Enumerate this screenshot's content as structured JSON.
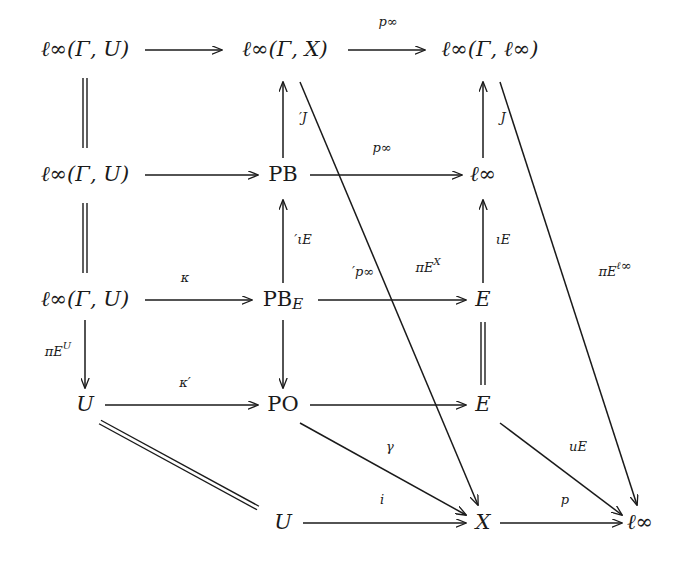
{
  "diagram": {
    "ink_color": "#1a1a1a",
    "background_color": "#ffffff",
    "nodes": [
      {
        "id": "n_r1c1",
        "label": "ℓ∞(Γ, U)",
        "x": 85,
        "y": 50,
        "style": "italic"
      },
      {
        "id": "n_r1c2",
        "label": "ℓ∞(Γ, X)",
        "x": 285,
        "y": 50,
        "style": "italic"
      },
      {
        "id": "n_r1c3",
        "label": "ℓ∞(Γ, ℓ∞)",
        "x": 490,
        "y": 50,
        "style": "italic"
      },
      {
        "id": "n_r2c1",
        "label": "ℓ∞(Γ, U)",
        "x": 85,
        "y": 175,
        "style": "italic"
      },
      {
        "id": "n_r2c2",
        "label": "PB",
        "x": 283,
        "y": 175,
        "style": "upright"
      },
      {
        "id": "n_r2c3",
        "label": "ℓ∞",
        "x": 483,
        "y": 175,
        "style": "italic"
      },
      {
        "id": "n_r3c1",
        "label": "ℓ∞(Γ, U)",
        "x": 85,
        "y": 300,
        "style": "italic"
      },
      {
        "id": "n_r3c2",
        "label": "PB_E",
        "x": 283,
        "y": 300,
        "style": "upright"
      },
      {
        "id": "n_r3c3",
        "label": "E",
        "x": 483,
        "y": 300,
        "style": "italic"
      },
      {
        "id": "n_r4c1",
        "label": "U",
        "x": 85,
        "y": 405,
        "style": "italic"
      },
      {
        "id": "n_r4c2",
        "label": "PO",
        "x": 283,
        "y": 405,
        "style": "upright"
      },
      {
        "id": "n_r4c3",
        "label": "E",
        "x": 483,
        "y": 405,
        "style": "italic"
      },
      {
        "id": "n_r5c1",
        "label": "U",
        "x": 283,
        "y": 523,
        "style": "italic"
      },
      {
        "id": "n_r5c2",
        "label": "X",
        "x": 483,
        "y": 523,
        "style": "italic"
      },
      {
        "id": "n_r5c3",
        "label": "ℓ∞",
        "x": 640,
        "y": 523,
        "style": "italic"
      }
    ],
    "edge_labels": [
      {
        "id": "lbl_p_inf_top",
        "text": "p∞",
        "x": 388,
        "y": 22,
        "note": "above top-right horizontal arrow"
      },
      {
        "id": "lbl_J_prime",
        "text": "′J",
        "x": 303,
        "y": 118,
        "note": "right of PB up-arrow"
      },
      {
        "id": "lbl_J",
        "text": "J",
        "x": 503,
        "y": 118,
        "note": "right of l-infinity up-arrow"
      },
      {
        "id": "lbl_p_inf_row2",
        "text": "p∞",
        "x": 382,
        "y": 148,
        "note": "above PB to l-infinity arrow"
      },
      {
        "id": "lbl_iota_prime_E",
        "text": "′ιE",
        "x": 303,
        "y": 240,
        "note": "right of PB_E up-arrow"
      },
      {
        "id": "lbl_iota_E",
        "text": "ιE",
        "x": 503,
        "y": 240,
        "note": "right of E up-arrow"
      },
      {
        "id": "lbl_kappa",
        "text": "κ",
        "x": 185,
        "y": 278,
        "note": "above l-infinity(G,U) to PB_E arrow"
      },
      {
        "id": "lbl_p_inf_prime",
        "text": "′p∞",
        "x": 363,
        "y": 272,
        "note": "above PB_E to E arrow"
      },
      {
        "id": "lbl_pi_E_X",
        "text": "πE^X",
        "x": 428,
        "y": 268,
        "note": "diagonal to X"
      },
      {
        "id": "lbl_pi_E_linf",
        "text": "πE^ℓ∞",
        "x": 615,
        "y": 272,
        "note": "diagonal to l-infinity"
      },
      {
        "id": "lbl_pi_E_U",
        "text": "πE^U",
        "x": 58,
        "y": 352,
        "note": "left of down arrow to U"
      },
      {
        "id": "lbl_kappa_prime",
        "text": "κ′",
        "x": 185,
        "y": 383,
        "note": "above U to PO arrow"
      },
      {
        "id": "lbl_gamma",
        "text": "γ",
        "x": 390,
        "y": 447,
        "note": "diagonal PO to X"
      },
      {
        "id": "lbl_u_E",
        "text": "uE",
        "x": 578,
        "y": 447,
        "note": "diagonal E to l-infinity"
      },
      {
        "id": "lbl_i",
        "text": "i",
        "x": 382,
        "y": 500,
        "note": "above U to X arrow"
      },
      {
        "id": "lbl_p",
        "text": "p",
        "x": 565,
        "y": 500,
        "note": "above X to l-infinity arrow"
      }
    ],
    "arrows": [
      {
        "id": "a_r1_c1_c2",
        "kind": "single",
        "x1": 145,
        "y1": 50,
        "x2": 222,
        "y2": 50
      },
      {
        "id": "a_r1_c2_c3",
        "kind": "single",
        "x1": 348,
        "y1": 50,
        "x2": 425,
        "y2": 50
      },
      {
        "id": "a_r2_c1_c2",
        "kind": "single",
        "x1": 145,
        "y1": 175,
        "x2": 258,
        "y2": 175
      },
      {
        "id": "a_r2_c2_c3",
        "kind": "single",
        "x1": 310,
        "y1": 175,
        "x2": 462,
        "y2": 175
      },
      {
        "id": "a_r3_c1_c2",
        "kind": "single",
        "x1": 145,
        "y1": 300,
        "x2": 252,
        "y2": 300
      },
      {
        "id": "a_r3_c2_c3",
        "kind": "single",
        "x1": 318,
        "y1": 300,
        "x2": 466,
        "y2": 300
      },
      {
        "id": "a_r4_c1_c2",
        "kind": "single",
        "x1": 105,
        "y1": 405,
        "x2": 258,
        "y2": 405
      },
      {
        "id": "a_r4_c2_c3",
        "kind": "single",
        "x1": 310,
        "y1": 405,
        "x2": 466,
        "y2": 405
      },
      {
        "id": "a_r5_c1_c2",
        "kind": "single",
        "x1": 303,
        "y1": 523,
        "x2": 466,
        "y2": 523
      },
      {
        "id": "a_r5_c2_c3",
        "kind": "single",
        "x1": 500,
        "y1": 523,
        "x2": 622,
        "y2": 523
      },
      {
        "id": "a_pb_up",
        "kind": "single",
        "x1": 283,
        "y1": 158,
        "x2": 283,
        "y2": 82
      },
      {
        "id": "a_linf_up",
        "kind": "single",
        "x1": 483,
        "y1": 158,
        "x2": 483,
        "y2": 82
      },
      {
        "id": "a_pbe_up",
        "kind": "single",
        "x1": 283,
        "y1": 283,
        "x2": 283,
        "y2": 200
      },
      {
        "id": "a_E_up",
        "kind": "single",
        "x1": 483,
        "y1": 283,
        "x2": 483,
        "y2": 200
      },
      {
        "id": "a_linfGU_down",
        "kind": "single",
        "x1": 85,
        "y1": 320,
        "x2": 85,
        "y2": 388
      },
      {
        "id": "a_pbe_down",
        "kind": "single",
        "x1": 283,
        "y1": 320,
        "x2": 283,
        "y2": 388
      },
      {
        "id": "a_diag_X",
        "kind": "single",
        "x1": 300,
        "y1": 82,
        "x2": 478,
        "y2": 505
      },
      {
        "id": "a_diag_linf",
        "kind": "single",
        "x1": 500,
        "y1": 82,
        "x2": 637,
        "y2": 505
      },
      {
        "id": "a_diag_gamma",
        "kind": "single",
        "x1": 300,
        "y1": 423,
        "x2": 466,
        "y2": 515
      },
      {
        "id": "a_diag_uE",
        "kind": "single",
        "x1": 500,
        "y1": 423,
        "x2": 622,
        "y2": 515
      }
    ],
    "equalities": [
      {
        "id": "eq_c1_r1_r2",
        "x1": 85,
        "y1": 78,
        "x2": 85,
        "y2": 148,
        "gap": 4
      },
      {
        "id": "eq_c1_r2_r3",
        "x1": 85,
        "y1": 203,
        "x2": 85,
        "y2": 273,
        "gap": 4
      },
      {
        "id": "eq_c3_r3_r4",
        "x1": 483,
        "y1": 322,
        "x2": 483,
        "y2": 385,
        "gap": 4
      },
      {
        "id": "eq_diag_U_U",
        "x1": 100,
        "y1": 422,
        "x2": 258,
        "y2": 508,
        "gap": 4
      }
    ]
  }
}
